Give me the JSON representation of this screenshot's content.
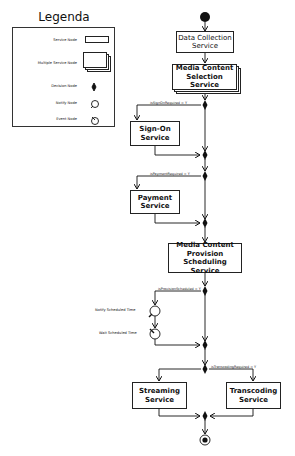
{
  "legend": {
    "title": "Legenda",
    "items": [
      {
        "label": "Service Node",
        "icon": "service-node-icon"
      },
      {
        "label": "Multiple Service Node",
        "icon": "multiple-service-node-icon"
      },
      {
        "label": "Decision Node",
        "icon": "decision-node-icon"
      },
      {
        "label": "Notify Node",
        "icon": "notify-node-icon"
      },
      {
        "label": "Event Node",
        "icon": "event-node-icon"
      }
    ]
  },
  "flow": {
    "nodes": {
      "data_collection": "Data Collection Service",
      "media_selection": "Media Content Selection Service",
      "sign_on": "Sign-On Service",
      "payment": "Payment Service",
      "provision_scheduling": "Media Content Provision Scheduling Service",
      "notify": "Notify Scheduled Time",
      "wait": "Wait Scheduled Time",
      "streaming": "Streaming Service",
      "transcoding": "Transcoding Service"
    },
    "conditions": {
      "sign_on": "isSignOnRequired = Y",
      "payment": "isPaymentRequired = Y",
      "provision": "isProvisionScheduled = Y",
      "transcoding": "isTranscodingRequired = Y"
    }
  }
}
